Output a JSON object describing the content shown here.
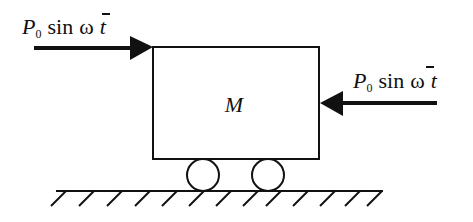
{
  "diagram": {
    "mass": {
      "label": "M"
    },
    "forces": [
      {
        "id": "left",
        "symbol": "P",
        "subscript": "0",
        "func": "sin",
        "omega": "ω",
        "var": "t",
        "direction": "right"
      },
      {
        "id": "right",
        "symbol": "P",
        "subscript": "0",
        "func": "sin",
        "omega": "ω",
        "var": "t",
        "direction": "left"
      }
    ],
    "supports": {
      "wheels": 2,
      "ground": "hatched"
    }
  }
}
